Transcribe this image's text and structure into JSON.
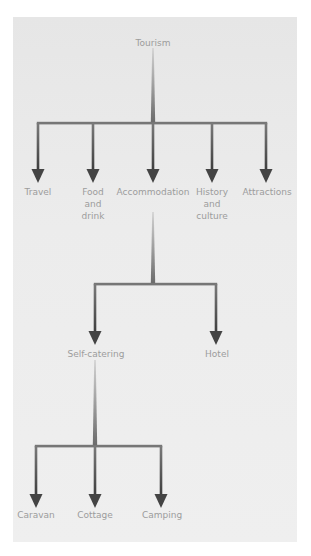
{
  "diagram": {
    "type": "tree",
    "colors": {
      "background": "#ffffff",
      "panel": "#ececec",
      "line_light": "#c4c4c4",
      "line_dark": "#505050",
      "label": "#9c9c9c"
    },
    "root": {
      "label": "Tourism",
      "children": [
        {
          "label": "Travel"
        },
        {
          "label": "Food\nand\ndrink"
        },
        {
          "label": "Accommodation",
          "children": [
            {
              "label": "Self-catering",
              "children": [
                {
                  "label": "Caravan"
                },
                {
                  "label": "Cottage"
                },
                {
                  "label": "Camping"
                }
              ]
            },
            {
              "label": "Hotel"
            }
          ]
        },
        {
          "label": "History\nand\nculture"
        },
        {
          "label": "Attractions"
        }
      ]
    }
  }
}
